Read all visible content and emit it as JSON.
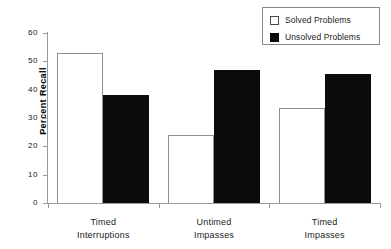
{
  "chart_data": {
    "type": "bar",
    "title": "",
    "subtitle": "",
    "xlabel": "",
    "ylabel": "Percent Recall",
    "ylim": [
      0,
      60
    ],
    "ytick_labels": [
      "0",
      "10",
      "20",
      "30",
      "40",
      "50",
      "60"
    ],
    "ytick_values": [
      0,
      10,
      20,
      30,
      40,
      50,
      60
    ],
    "grid": false,
    "legend_position": "top-right",
    "categories": [
      "Timed Interruptions",
      "Untimed Impasses",
      "Timed Impasses"
    ],
    "category_lines": [
      [
        "Timed",
        "Interruptions"
      ],
      [
        "Untimed",
        "Impasses"
      ],
      [
        "Timed",
        "Impasses"
      ]
    ],
    "series": [
      {
        "name": "Solved Problems",
        "values": [
          53,
          24,
          33.5
        ],
        "fill": "#ffffff",
        "edge": "#8f8f8f"
      },
      {
        "name": "Unsolved Problems",
        "values": [
          38,
          47,
          45.5
        ],
        "fill": "#0b0b0b",
        "edge": "#0b0b0b"
      }
    ]
  },
  "legend": {
    "entries": [
      {
        "label": "Solved Problems",
        "swatch": "open-square-icon"
      },
      {
        "label": "Unsolved Problems",
        "swatch": "filled-square-icon"
      }
    ]
  },
  "axes": {
    "y_label": "Percent Recall",
    "y_ticks": [
      "60",
      "50",
      "40",
      "30",
      "20",
      "10",
      "0"
    ]
  },
  "colors": {
    "axis": "#9a9a9a",
    "text": "#1a1a1a",
    "solved_fill": "#ffffff",
    "unsolved_fill": "#0b0b0b",
    "legend_border": "#8a8a8a"
  }
}
